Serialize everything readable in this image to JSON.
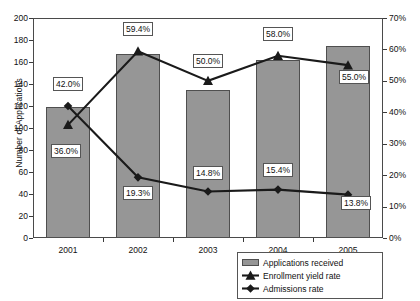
{
  "chart_data": {
    "type": "bar",
    "title": "",
    "categories": [
      "2001",
      "2002",
      "2003",
      "2004",
      "2005"
    ],
    "xlabel": "",
    "ylabel": "Number of Applications",
    "ylabel_right": "",
    "ylim": [
      0,
      200
    ],
    "ylim_right": [
      0,
      70
    ],
    "ytick_step": 20,
    "ytick_step_right": 10,
    "yticks": [
      "200",
      "180",
      "160",
      "140",
      "120",
      "100",
      "80",
      "60",
      "40",
      "20",
      "0"
    ],
    "yticks_right": [
      "70%",
      "60%",
      "50%",
      "40%",
      "30%",
      "20%",
      "10%",
      "0%"
    ],
    "grid": false,
    "legend_position": "bottom-right",
    "series": [
      {
        "name": "Applications received",
        "type": "bar",
        "axis": "left",
        "marker": "none",
        "color": "#969696",
        "values": [
          119,
          167,
          135,
          162,
          175
        ],
        "labels": [
          "",
          "",
          "",
          "",
          ""
        ]
      },
      {
        "name": "Enrollment yield rate",
        "type": "line",
        "axis": "right",
        "marker": "triangle",
        "color": "#1a1a1a",
        "values": [
          36.0,
          59.4,
          50.0,
          58.0,
          55.0
        ],
        "labels": [
          "36.0%",
          "59.4%",
          "50.0%",
          "58.0%",
          "55.0%"
        ]
      },
      {
        "name": "Admissions rate",
        "type": "line",
        "axis": "right",
        "marker": "diamond",
        "color": "#1a1a1a",
        "values": [
          42.0,
          19.3,
          14.8,
          15.4,
          13.8
        ],
        "labels": [
          "42.0%",
          "19.3%",
          "14.8%",
          "15.4%",
          "13.8%"
        ]
      }
    ]
  },
  "legend": {
    "items": [
      {
        "label": "Applications received",
        "marker": "bar"
      },
      {
        "label": "Enrollment yield rate",
        "marker": "triangle"
      },
      {
        "label": "Admissions rate",
        "marker": "diamond"
      }
    ]
  },
  "axes": {
    "left_title": "Number of Applications"
  }
}
